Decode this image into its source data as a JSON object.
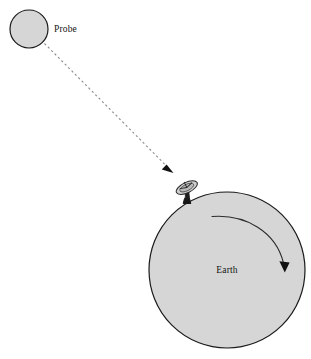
{
  "figure": {
    "background_color": "#ffffff",
    "body_fill_color": "#d6d6d6",
    "body_stroke_color": "#1a1a1a",
    "trajectory_color": "#8a8a8a",
    "arrow_color": "#111111"
  },
  "labels": {
    "probe": "Probe",
    "earth": "Earth"
  },
  "objects": {
    "probe": {
      "name": "probe-circle",
      "cx": 29,
      "cy": 29,
      "r": 19
    },
    "earth": {
      "name": "earth-circle",
      "cx": 227,
      "cy": 270,
      "r": 78
    },
    "antenna": {
      "name": "satellite-dish",
      "base_x": 190,
      "base_y": 199
    }
  },
  "annotations": {
    "trajectory": {
      "name": "probe-trajectory-arrow",
      "start_x": 44,
      "start_y": 44,
      "end_x": 172,
      "end_y": 172,
      "style": "dashed",
      "arrowhead": "solid-triangle"
    },
    "rotation": {
      "name": "earth-rotation-arrow",
      "direction": "clockwise",
      "start_x": 212,
      "start_y": 216,
      "end_x": 284,
      "end_y": 272,
      "arrowhead": "solid-triangle"
    }
  }
}
